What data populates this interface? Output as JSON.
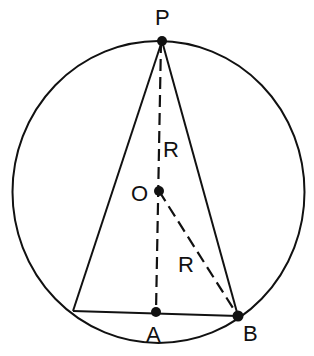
{
  "diagram": {
    "colors": {
      "stroke": "#111111",
      "background": "#ffffff"
    },
    "circle": {
      "cx": 158.5,
      "cy": 192,
      "rx": 146,
      "ry": 151
    },
    "points": {
      "P": {
        "label": "P",
        "x": 162,
        "y": 41
      },
      "O": {
        "label": "O",
        "x": 159,
        "y": 191
      },
      "A": {
        "label": "A",
        "x": 156,
        "y": 312
      },
      "B": {
        "label": "B",
        "x": 238,
        "y": 316
      },
      "C": {
        "label": "",
        "x": 73,
        "y": 311
      }
    },
    "segments": [
      {
        "name": "PC",
        "style": "solid"
      },
      {
        "name": "PB",
        "style": "solid"
      },
      {
        "name": "CB",
        "style": "solid"
      },
      {
        "name": "PA",
        "style": "dashed"
      },
      {
        "name": "OB",
        "style": "dashed"
      }
    ],
    "labels": {
      "P": "P",
      "O": "O",
      "A": "A",
      "B": "B",
      "R_upper": "R",
      "R_lower": "R"
    }
  }
}
